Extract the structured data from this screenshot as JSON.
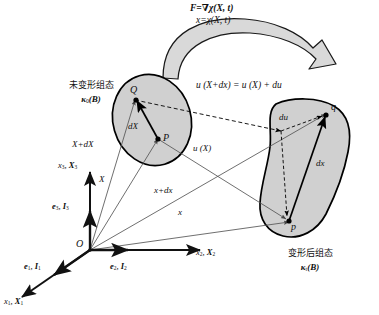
{
  "figure": {
    "type": "continuum-mechanics-deformation-diagram",
    "title_equations": {
      "line1": "F=∇χ(X, t)",
      "line2": "x=χ(X, t)"
    },
    "configurations": {
      "reference": {
        "name_cn": "未变形组态",
        "symbol": "κ",
        "symbol_sub": "0",
        "symbol_arg": "(B)",
        "points": [
          "Q",
          "P"
        ],
        "segment_label": "dX"
      },
      "current": {
        "name_cn": "变形后组态",
        "symbol": "κ",
        "symbol_sub": "t",
        "symbol_arg": "(B)",
        "points": [
          "q",
          "p"
        ],
        "segment_label": "dx"
      }
    },
    "displacement_equation": "u (X+dx) = u (X) + du",
    "vectors": {
      "X_plus_dX": "X+dX",
      "X": "X",
      "u_of_X": "u (X)",
      "x_plus_dx": "x+dx",
      "x": "x",
      "du": "du",
      "dX": "dX",
      "dx": "dx"
    },
    "frame": {
      "origin": "O",
      "axes": [
        {
          "name": "axis-1",
          "coord": "x",
          "coord_sub": "1",
          "material": "X",
          "material_sub": "1"
        },
        {
          "name": "axis-2",
          "coord": "x",
          "coord_sub": "2",
          "material": "X",
          "material_sub": "2"
        },
        {
          "name": "axis-3",
          "coord": "x",
          "coord_sub": "3",
          "material": "X",
          "material_sub": "3"
        }
      ],
      "bases": [
        {
          "name": "basis-1",
          "spatial": "e",
          "spatial_sub": "1",
          "material": "I",
          "material_sub": "1"
        },
        {
          "name": "basis-2",
          "spatial": "e",
          "spatial_sub": "2",
          "material": "I",
          "material_sub": "2"
        },
        {
          "name": "basis-3",
          "spatial": "e",
          "spatial_sub": "3",
          "material": "I",
          "material_sub": "3"
        }
      ]
    },
    "colors": {
      "body_fill": "#d0d0d0",
      "body_stroke": "#000000",
      "arrow_fill": "#d9d9d9",
      "thin_line": "#555555",
      "text": "#111111",
      "background": "#ffffff"
    }
  }
}
